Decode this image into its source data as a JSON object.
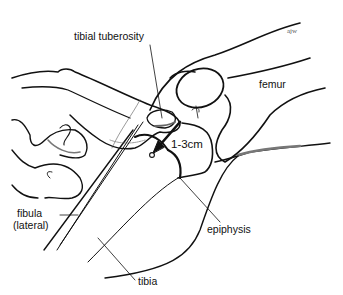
{
  "figure": {
    "type": "anatomical line drawing",
    "colors": {
      "ink": "#111111",
      "background": "#ffffff"
    }
  },
  "labels": {
    "tibial_tuberosity": "tibial tuberosity",
    "femur": "femur",
    "measurement": "1-3cm",
    "fibula_line1": "fibula",
    "fibula_line2": "(lateral)",
    "epiphysis": "epiphysis",
    "tibia": "tibia",
    "signature": "ajw"
  }
}
